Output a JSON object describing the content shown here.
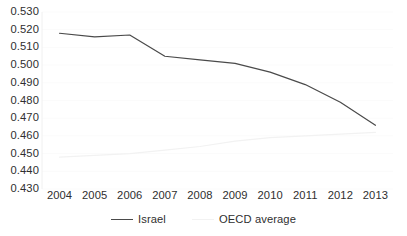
{
  "chart_data": {
    "type": "line",
    "title": "",
    "xlabel": "",
    "ylabel": "",
    "categories": [
      "2004",
      "2005",
      "2006",
      "2007",
      "2008",
      "2009",
      "2010",
      "2011",
      "2012",
      "2013"
    ],
    "series": [
      {
        "name": "Israel",
        "color": "#4a4a4a",
        "values": [
          0.518,
          0.516,
          0.517,
          0.505,
          0.503,
          0.501,
          0.496,
          0.489,
          0.479,
          0.466
        ]
      },
      {
        "name": "OECD average",
        "color": "#f2f2f2",
        "values": [
          0.448,
          0.449,
          0.45,
          0.452,
          0.454,
          0.457,
          0.459,
          0.46,
          0.461,
          0.462
        ]
      }
    ],
    "ylim": [
      0.43,
      0.53
    ],
    "ytick_labels": [
      "0.530",
      "0.520",
      "0.510",
      "0.500",
      "0.490",
      "0.480",
      "0.470",
      "0.460",
      "0.450",
      "0.440",
      "0.430"
    ],
    "ytick_values": [
      0.53,
      0.52,
      0.51,
      0.5,
      0.49,
      0.48,
      0.47,
      0.46,
      0.45,
      0.44,
      0.43
    ],
    "grid": true,
    "legend_position": "bottom"
  },
  "legend": {
    "items": [
      {
        "label": "Israel"
      },
      {
        "label": "OECD average"
      }
    ]
  }
}
